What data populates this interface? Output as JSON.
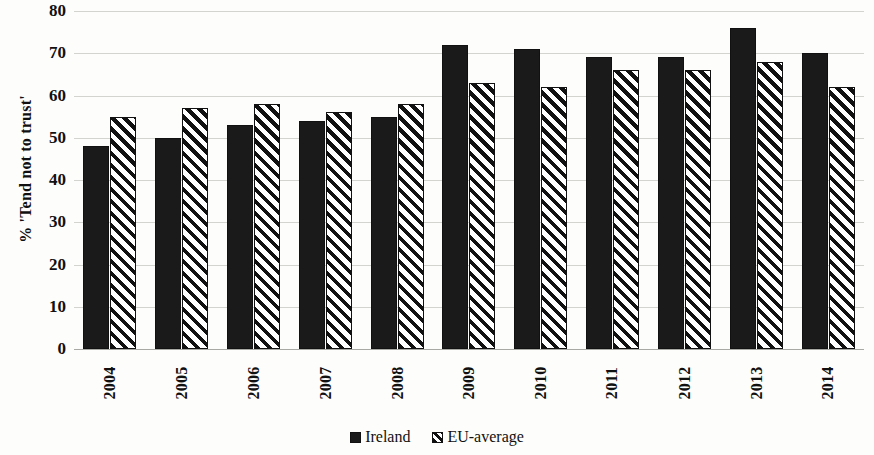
{
  "chart_data": {
    "type": "bar",
    "title": "",
    "subtitle": "",
    "xlabel": "",
    "ylabel": "% 'Tend not to trust'",
    "categories": [
      "2004",
      "2005",
      "2006",
      "2007",
      "2008",
      "2009",
      "2010",
      "2011",
      "2012",
      "2013",
      "2014"
    ],
    "series": [
      {
        "name": "Ireland",
        "values": [
          48,
          50,
          53,
          54,
          55,
          72,
          71,
          69,
          69,
          76,
          70
        ]
      },
      {
        "name": "EU-average",
        "values": [
          55,
          57,
          58,
          56,
          58,
          63,
          62,
          66,
          66,
          68,
          62
        ]
      }
    ],
    "ylim": [
      0,
      80
    ],
    "ytick_labels": [
      "80",
      "70",
      "60",
      "50",
      "40",
      "30",
      "20",
      "10",
      "0"
    ],
    "ytick_values": [
      80,
      70,
      60,
      50,
      40,
      30,
      20,
      10,
      0
    ],
    "grid": true,
    "legend_position": "bottom",
    "legend": [
      {
        "label": "Ireland",
        "pattern": "solid-black"
      },
      {
        "label": "EU-average",
        "pattern": "diagonal-hatch"
      }
    ],
    "colors": {
      "bar_fill": "#1a1a1a",
      "bar_outline": "#111111",
      "gridline": "#d3d3cf",
      "background": "#fdfdfc",
      "text": "#111111"
    }
  }
}
